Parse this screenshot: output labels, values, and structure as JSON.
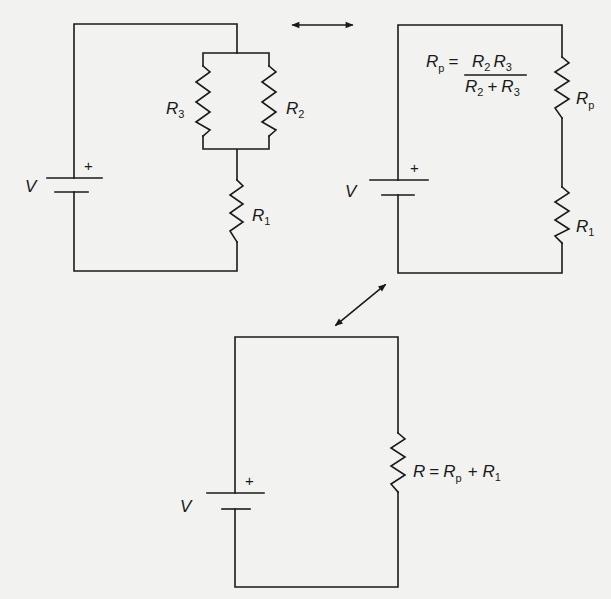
{
  "diagram": {
    "type": "circuit-equivalence",
    "colors": {
      "background": "#f2f2f0",
      "ink": "#1a1a1a"
    },
    "circuits": [
      {
        "id": "original",
        "battery": {
          "label": "V",
          "polarity": "+"
        },
        "resistors": [
          {
            "label": "R",
            "sub": "3"
          },
          {
            "label": "R",
            "sub": "2"
          },
          {
            "label": "R",
            "sub": "1"
          }
        ],
        "topology": "R3 parallel R2, in series with R1"
      },
      {
        "id": "reduced",
        "battery": {
          "label": "V",
          "polarity": "+"
        },
        "resistors": [
          {
            "label": "R",
            "sub": "p"
          },
          {
            "label": "R",
            "sub": "1"
          }
        ],
        "formula": {
          "lhs": "R",
          "lhs_sub": "p",
          "eq": "=",
          "num": [
            {
              "label": "R",
              "sub": "2"
            },
            {
              "label": "R",
              "sub": "3"
            }
          ],
          "den": [
            {
              "label": "R",
              "sub": "2"
            },
            {
              "op": "+"
            },
            {
              "label": "R",
              "sub": "3"
            }
          ]
        }
      },
      {
        "id": "equivalent",
        "battery": {
          "label": "V",
          "polarity": "+"
        },
        "resistors": [
          {
            "label": "R"
          }
        ],
        "formula": {
          "lhs": "R",
          "eq": "=",
          "t1": "R",
          "t1_sub": "p",
          "op": "+",
          "t2": "R",
          "t2_sub": "1"
        }
      }
    ],
    "arrows": [
      {
        "from": "original",
        "to": "reduced",
        "style": "double-headed",
        "orientation": "horizontal"
      },
      {
        "from": "reduced",
        "to": "equivalent",
        "style": "double-headed",
        "orientation": "diagonal"
      }
    ]
  }
}
